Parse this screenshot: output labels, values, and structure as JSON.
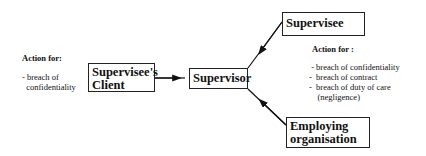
{
  "nodes": {
    "client": {
      "label_line1": "Supervisee's",
      "label_line2": "Client"
    },
    "supervisor": {
      "label": "Supervisor"
    },
    "supervisee": {
      "label": "Supervisee"
    },
    "employer": {
      "label_line1": "Employing",
      "label_line2": "organisation"
    }
  },
  "left_actions": {
    "heading": "Action for:",
    "items": [
      "- breach of",
      "  confidentiality"
    ]
  },
  "right_actions": {
    "heading": "Action for :",
    "items": [
      " - breach of confidentiality",
      "-  breach of contract",
      "-  breach of duty of care",
      "    (negligence)"
    ]
  },
  "edges": [
    {
      "from": "client",
      "to": "supervisor"
    },
    {
      "from": "supervisee",
      "to": "supervisor"
    },
    {
      "from": "employer",
      "to": "supervisor"
    }
  ]
}
